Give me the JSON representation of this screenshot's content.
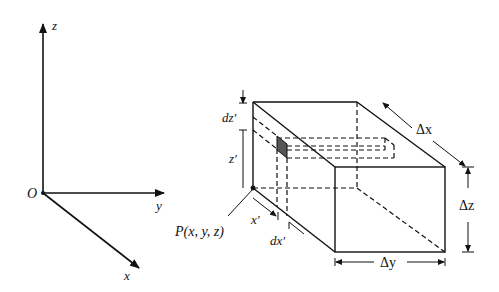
{
  "axes": {
    "origin_label": "O",
    "x_label": "x",
    "y_label": "y",
    "z_label": "z"
  },
  "box": {
    "point_label": "P(x, y, z)",
    "x_prime": "x'",
    "dx_prime": "dx'",
    "z_prime": "z'",
    "dz_prime": "dz'",
    "delta_x": "Δx",
    "delta_y": "Δy",
    "delta_z": "Δz"
  },
  "colors": {
    "line": "#111111",
    "element_fill": "#555555"
  }
}
